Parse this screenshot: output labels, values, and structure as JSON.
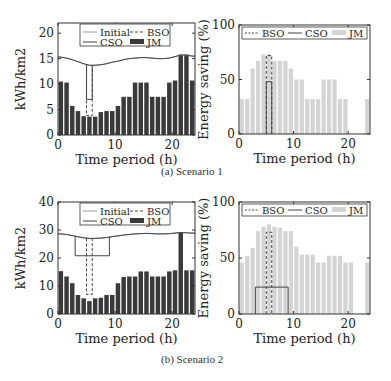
{
  "captions": {
    "a": "(a) Scenario 1",
    "b": "(b) Scenario 2"
  },
  "colors": {
    "jm_dark": "#3a3a3a",
    "jm_light": "#d4d4d4",
    "line": "#444444",
    "initial": "#9a9a9a"
  },
  "chart_data": [
    {
      "id": "s1-energy",
      "type": "bar",
      "title": "",
      "xlabel": "Time period (h)",
      "ylabel": "kWh/km2",
      "xlim": [
        0,
        24
      ],
      "ylim": [
        0,
        22
      ],
      "xticks": [
        0,
        10,
        20
      ],
      "yticks": [
        0,
        5,
        10,
        15,
        20
      ],
      "legend": [
        "Initial",
        "BSO",
        "CSO",
        "JM"
      ],
      "legend_position": "upper center",
      "x": [
        1,
        2,
        3,
        4,
        5,
        6,
        7,
        8,
        9,
        10,
        11,
        12,
        13,
        14,
        15,
        16,
        17,
        18,
        19,
        20,
        21,
        22,
        23,
        24
      ],
      "series": [
        {
          "name": "Initial",
          "style": "line",
          "values": [
            15.3,
            15.1,
            14.8,
            14.4,
            14.0,
            13.7,
            13.7,
            13.8,
            14.0,
            14.3,
            14.5,
            14.8,
            15.0,
            15.1,
            15.2,
            15.2,
            15.1,
            15.0,
            15.0,
            15.1,
            15.4,
            15.7,
            15.7,
            15.5
          ]
        },
        {
          "name": "CSO",
          "style": "line",
          "values": [
            15.3,
            15.1,
            14.8,
            14.4,
            14.0,
            13.7,
            13.7,
            13.8,
            14.0,
            14.3,
            14.5,
            14.8,
            15.0,
            15.1,
            15.2,
            15.2,
            15.1,
            15.0,
            15.0,
            15.1,
            15.4,
            15.7,
            15.7,
            15.5
          ]
        },
        {
          "name": "CSO-reduced",
          "style": "line",
          "x_range": [
            5.5,
            6.5
          ],
          "value": 7.0
        },
        {
          "name": "BSO",
          "style": "dashed",
          "x_range": [
            5.5,
            6.5
          ],
          "value": 3.8
        },
        {
          "name": "JM",
          "style": "bar",
          "values": [
            10.5,
            10.3,
            5.7,
            4.7,
            3.7,
            3.6,
            3.6,
            4.5,
            4.7,
            4.7,
            5.7,
            7.5,
            7.5,
            10.3,
            10.3,
            10.3,
            7.5,
            7.5,
            7.5,
            10.3,
            10.7,
            15.8,
            15.8,
            10.7
          ]
        }
      ]
    },
    {
      "id": "s1-saving",
      "type": "bar",
      "title": "",
      "xlabel": "Time period (h)",
      "ylabel": "Energy saving (%)",
      "xlim": [
        0,
        24
      ],
      "ylim": [
        0,
        100
      ],
      "xticks": [
        0,
        10,
        20
      ],
      "yticks": [
        0,
        50,
        100
      ],
      "legend": [
        "BSO",
        "CSO",
        "JM"
      ],
      "legend_position": "top",
      "x": [
        1,
        2,
        3,
        4,
        5,
        6,
        7,
        8,
        9,
        10,
        11,
        12,
        13,
        14,
        15,
        16,
        17,
        18,
        19,
        20,
        21,
        22,
        23,
        24
      ],
      "series": [
        {
          "name": "JM",
          "style": "bar",
          "values": [
            32,
            32,
            60,
            67,
            73,
            73,
            67,
            67,
            67,
            60,
            50,
            50,
            32,
            32,
            32,
            50,
            50,
            50,
            32,
            32,
            0,
            0,
            0,
            32
          ]
        },
        {
          "name": "BSO",
          "style": "dashed",
          "x_range": [
            5.5,
            6.5
          ],
          "value": 72
        },
        {
          "name": "CSO",
          "style": "line",
          "x_range": [
            5.5,
            6.5
          ],
          "value": 48
        }
      ]
    },
    {
      "id": "s2-energy",
      "type": "bar",
      "title": "",
      "xlabel": "Time period (h)",
      "ylabel": "kWh/km2",
      "xlim": [
        0,
        24
      ],
      "ylim": [
        0,
        40
      ],
      "xticks": [
        0,
        10,
        20
      ],
      "yticks": [
        0,
        10,
        20,
        30,
        40
      ],
      "legend": [
        "Initial",
        "BSO",
        "CSO",
        "JM"
      ],
      "legend_position": "upper center",
      "x": [
        1,
        2,
        3,
        4,
        5,
        6,
        7,
        8,
        9,
        10,
        11,
        12,
        13,
        14,
        15,
        16,
        17,
        18,
        19,
        20,
        21,
        22,
        23,
        24
      ],
      "series": [
        {
          "name": "Initial",
          "style": "line",
          "values": [
            28.6,
            28.4,
            28.0,
            27.6,
            27.2,
            27.0,
            27.0,
            27.1,
            27.3,
            27.6,
            27.9,
            28.2,
            28.4,
            28.6,
            28.7,
            28.8,
            28.7,
            28.6,
            28.6,
            28.7,
            28.9,
            29.1,
            29.0,
            28.9
          ]
        },
        {
          "name": "CSO",
          "style": "line",
          "values": [
            28.6,
            28.4,
            28.0,
            27.6,
            27.2,
            27.0,
            27.0,
            27.1,
            27.3,
            27.6,
            27.9,
            28.2,
            28.4,
            28.6,
            28.7,
            28.8,
            28.7,
            28.6,
            28.6,
            28.7,
            28.9,
            29.1,
            29.0,
            28.9
          ]
        },
        {
          "name": "CSO-reduced",
          "style": "line",
          "x_range": [
            3.5,
            9.5
          ],
          "value": 20.8
        },
        {
          "name": "BSO",
          "style": "dashed",
          "x_range": [
            5.5,
            6.5
          ],
          "value": 7.0
        },
        {
          "name": "JM",
          "style": "bar",
          "values": [
            15.3,
            13.4,
            11.0,
            6.8,
            5.6,
            4.6,
            5.6,
            5.8,
            6.8,
            6.8,
            11.0,
            13.2,
            13.4,
            13.4,
            15.2,
            15.2,
            13.4,
            13.4,
            13.4,
            15.2,
            15.6,
            29.0,
            15.6,
            15.6
          ]
        }
      ]
    },
    {
      "id": "s2-saving",
      "type": "bar",
      "title": "",
      "xlabel": "Time period (h)",
      "ylabel": "Energy saving (%)",
      "xlim": [
        0,
        24
      ],
      "ylim": [
        0,
        100
      ],
      "xticks": [
        0,
        10,
        20
      ],
      "yticks": [
        0,
        50,
        100
      ],
      "legend": [
        "BSO",
        "CSO",
        "JM"
      ],
      "legend_position": "top",
      "x": [
        1,
        2,
        3,
        4,
        5,
        6,
        7,
        8,
        9,
        10,
        11,
        12,
        13,
        14,
        15,
        16,
        17,
        18,
        19,
        20,
        21,
        22,
        23,
        24
      ],
      "series": [
        {
          "name": "JM",
          "style": "bar",
          "values": [
            46,
            52,
            59,
            74,
            78,
            80,
            78,
            77,
            74,
            74,
            60,
            53,
            53,
            53,
            46,
            46,
            52,
            52,
            52,
            46,
            46,
            0,
            0,
            46
          ]
        },
        {
          "name": "BSO",
          "style": "dashed",
          "x_range": [
            5.5,
            6.5
          ],
          "value": 73
        },
        {
          "name": "CSO",
          "style": "line",
          "x_range": [
            3.5,
            9.5
          ],
          "value": 24
        }
      ]
    }
  ]
}
